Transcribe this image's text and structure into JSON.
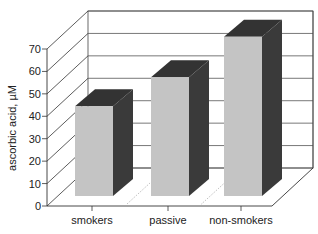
{
  "chart_data": {
    "type": "bar",
    "style": "3d",
    "title": "",
    "xlabel": "",
    "ylabel": "ascorbic acid, µM",
    "categories": [
      "smokers",
      "passive",
      "non-smokers"
    ],
    "values": [
      40,
      53,
      71
    ],
    "ylim": [
      0,
      70
    ],
    "yticks": [
      0,
      10,
      20,
      30,
      40,
      50,
      60,
      70
    ],
    "grid": true,
    "legend": null,
    "colors": {
      "front": "#c4c4c4",
      "side": "#3a3a3a",
      "top": "#333333",
      "grid": "#555555"
    }
  }
}
